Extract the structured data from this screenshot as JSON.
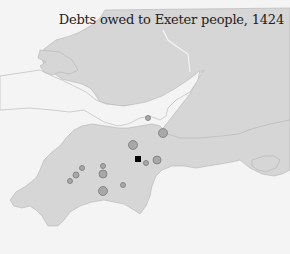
{
  "title": "Debts owed to Exeter people, 1424",
  "colors": {
    "sea": "#f4f4f4",
    "land": "#d6d6d6",
    "coast": "#b4b4b4",
    "marker_fill": "#a8a8a8",
    "marker_stroke": "#7a7a7a",
    "exeter": "#000000"
  },
  "places": [
    {
      "name": "exeter",
      "type": "square",
      "x": 138,
      "y": 159,
      "size": 6
    },
    {
      "name": "place-1",
      "type": "circle",
      "x": 148,
      "y": 118,
      "r": 2.5
    },
    {
      "name": "place-2",
      "type": "circle",
      "x": 163,
      "y": 133,
      "r": 4.5
    },
    {
      "name": "place-3",
      "type": "circle",
      "x": 133,
      "y": 145,
      "r": 4.5
    },
    {
      "name": "place-4",
      "type": "circle",
      "x": 146,
      "y": 163,
      "r": 2.5
    },
    {
      "name": "place-5",
      "type": "circle",
      "x": 157,
      "y": 160,
      "r": 4
    },
    {
      "name": "place-6",
      "type": "circle",
      "x": 82,
      "y": 168,
      "r": 2.5
    },
    {
      "name": "place-7",
      "type": "circle",
      "x": 76,
      "y": 175,
      "r": 3
    },
    {
      "name": "place-8",
      "type": "circle",
      "x": 70,
      "y": 181,
      "r": 2.5
    },
    {
      "name": "place-9",
      "type": "circle",
      "x": 103,
      "y": 166,
      "r": 2.5
    },
    {
      "name": "place-10",
      "type": "circle",
      "x": 103,
      "y": 174,
      "r": 4
    },
    {
      "name": "place-11",
      "type": "circle",
      "x": 123,
      "y": 185,
      "r": 2.5
    },
    {
      "name": "place-12",
      "type": "circle",
      "x": 103,
      "y": 191,
      "r": 4.5
    }
  ]
}
